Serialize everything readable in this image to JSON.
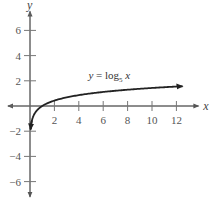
{
  "chart_data": {
    "type": "line",
    "title": "",
    "xlabel": "x",
    "ylabel": "y",
    "xlim": [
      -1.8,
      13.8
    ],
    "ylim": [
      -7.2,
      7.5
    ],
    "grid": false,
    "x_ticks": [
      2,
      4,
      6,
      8,
      10,
      12
    ],
    "y_ticks": [
      -6,
      -4,
      -2,
      2,
      4,
      6
    ],
    "x_tick_labels": [
      "2",
      "4",
      "6",
      "8",
      "10",
      "12"
    ],
    "y_tick_labels": [
      "−6",
      "−4",
      "−2",
      "2",
      "4",
      "6"
    ],
    "series": [
      {
        "name": "y = log5 x",
        "function": "log5(x)",
        "x": [
          0.06,
          0.1,
          0.2,
          0.3,
          0.5,
          0.75,
          1,
          1.5,
          2,
          3,
          4,
          5,
          6,
          8,
          10,
          12.5
        ],
        "y": [
          -1.75,
          -1.43,
          -1.0,
          -0.75,
          -0.43,
          -0.18,
          0,
          0.25,
          0.43,
          0.68,
          0.86,
          1.0,
          1.11,
          1.29,
          1.43,
          1.57
        ],
        "arrow_ends": true
      }
    ],
    "annotations": [
      {
        "text_main": "y = log",
        "text_sub": "5",
        "text_tail": " x",
        "x": 6.5,
        "y": 2.5
      }
    ],
    "legend": null
  }
}
